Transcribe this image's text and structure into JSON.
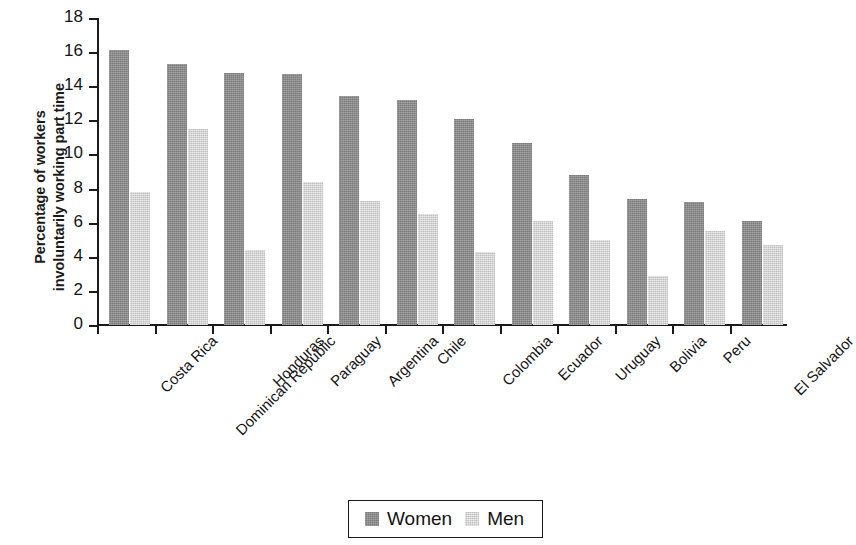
{
  "chart_data": {
    "type": "bar",
    "title": "",
    "xlabel": "",
    "ylabel": "Percentage of workers\ninvoluntarily working part time",
    "ylim": [
      0,
      18
    ],
    "ytick_labels": [
      "18",
      "16",
      "14",
      "12",
      "10",
      "8",
      "6",
      "4",
      "2",
      "0"
    ],
    "ytick_values": [
      18,
      16,
      14,
      12,
      10,
      8,
      6,
      4,
      2,
      0
    ],
    "grid": false,
    "legend_position": "bottom-center",
    "categories": [
      "Costa Rica",
      "Dominican Republic",
      "Honduras",
      "Paraguay",
      "Argentina",
      "Chile",
      "Colombia",
      "Ecuador",
      "Uruguay",
      "Bolivia",
      "Peru",
      "El Salvador"
    ],
    "series": [
      {
        "name": "Women",
        "color": "#8d8d8d",
        "values": [
          16.1,
          15.3,
          14.8,
          14.7,
          13.4,
          13.2,
          12.1,
          10.7,
          8.8,
          7.4,
          7.2,
          6.1
        ]
      },
      {
        "name": "Men",
        "color": "#d2d2d2",
        "values": [
          7.8,
          11.5,
          4.4,
          8.4,
          7.3,
          6.5,
          4.3,
          6.1,
          5.0,
          2.9,
          5.5,
          4.7
        ]
      }
    ]
  },
  "legend": {
    "entries": [
      {
        "label": "Women",
        "swatch": "women"
      },
      {
        "label": "Men",
        "swatch": "men"
      }
    ]
  }
}
